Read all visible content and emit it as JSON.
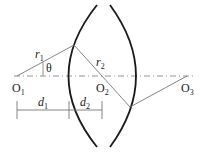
{
  "diagram": {
    "type": "lens-geometry",
    "points": {
      "O1": {
        "label": "O",
        "sub": "1"
      },
      "O2": {
        "label": "O",
        "sub": "2"
      },
      "O3": {
        "label": "O",
        "sub": "3"
      }
    },
    "radii": {
      "r1": {
        "label": "r",
        "sub": "1"
      },
      "r2": {
        "label": "r",
        "sub": "2"
      }
    },
    "angle": {
      "label": "θ"
    },
    "dimensions": {
      "d1": {
        "label": "d",
        "sub": "1"
      },
      "d2": {
        "label": "d",
        "sub": "2"
      }
    },
    "colors": {
      "lens": "#1a1a1a",
      "ray": "#777777",
      "axis": "#888888"
    }
  }
}
